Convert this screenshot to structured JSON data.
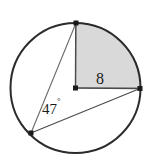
{
  "figure": {
    "background_color": "#ffffff",
    "width": 151,
    "height": 165
  },
  "circle": {
    "name": "circle-outline",
    "center_x": 75.5,
    "center_y": 88,
    "radius": 65,
    "stroke_color": "#2b2b2b",
    "stroke_width": 2,
    "fill": "none"
  },
  "sector": {
    "name": "shaded-sector",
    "fill_color": "#d9d9d9",
    "stroke_color": "#6e6e6e",
    "central_angle_degrees": 90,
    "path": "M 75.5 88 L 76 23 A 65 65 0 0 1 140.5 88 Z"
  },
  "points": [
    {
      "id": "top-point",
      "label": "",
      "x": 76,
      "y": 23,
      "size": 5,
      "color": "#1a1a1a"
    },
    {
      "id": "center-point",
      "label": "",
      "x": 75.5,
      "y": 88,
      "size": 5,
      "color": "#1a1a1a"
    },
    {
      "id": "right-point",
      "label": "",
      "x": 140,
      "y": 88.5,
      "size": 5,
      "color": "#1a1a1a"
    },
    {
      "id": "bottom-left-point",
      "label": "",
      "x": 31,
      "y": 133,
      "size": 5,
      "color": "#1a1a1a"
    }
  ],
  "segments": [
    {
      "id": "radius-vertical",
      "x1": 75.8,
      "y1": 23,
      "x2": 75.5,
      "y2": 88,
      "stroke": "#4a4a4a",
      "width": 1.4
    },
    {
      "id": "radius-horizontal",
      "x1": 75.5,
      "y1": 88,
      "x2": 140,
      "y2": 88.5,
      "stroke": "#4a4a4a",
      "width": 1.4
    },
    {
      "id": "chord-top-to-bottomleft",
      "x1": 76,
      "y1": 23,
      "x2": 31,
      "y2": 133,
      "stroke": "#6a6a6a",
      "width": 1.1
    },
    {
      "id": "chord-bottomleft-to-right",
      "x1": 31,
      "y1": 133,
      "x2": 140,
      "y2": 88.5,
      "stroke": "#4a4a4a",
      "width": 1.1
    }
  ],
  "labels": {
    "radius_measure": {
      "text": "8",
      "x": 100,
      "y": 84,
      "anchor": "middle",
      "description": "length of radius on shaded sector"
    },
    "inscribed_angle": {
      "value": "47",
      "degree_symbol": "°",
      "x": 42,
      "y": 114,
      "anchor": "start",
      "description": "inscribed angle at bottom-left vertex"
    }
  }
}
